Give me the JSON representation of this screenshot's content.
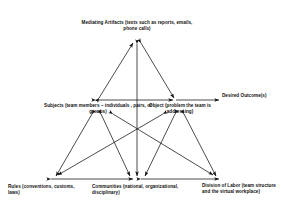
{
  "diagram": {
    "type": "activity-system-diagram",
    "stroke_color": "#111111",
    "background_color": "#ffffff",
    "nodes": [
      {
        "id": "mediating-artifacts",
        "label": "Mediating Artifacts (texts such as reports, emails, phone calls)",
        "x": 137,
        "y": 40
      },
      {
        "id": "subjects",
        "label": "Subjects (team members – individuals , pairs, or groups)",
        "x": 97,
        "y": 100
      },
      {
        "id": "object",
        "label": "Object (problem the team is addressing)",
        "x": 175,
        "y": 100
      },
      {
        "id": "desired-outcomes",
        "label": "Desired Outcome(s)",
        "x": 258,
        "y": 100
      },
      {
        "id": "rules",
        "label": "Rules (conventions, customs, laws)",
        "x": 53,
        "y": 178
      },
      {
        "id": "communities",
        "label": "Communities (national, organizational, disciplinary)",
        "x": 137,
        "y": 178
      },
      {
        "id": "division-of-labor",
        "label": "Division of Labor (team structure and the virtual workplace)",
        "x": 218,
        "y": 178
      }
    ],
    "edges": [
      {
        "from": "subjects",
        "to": "mediating-artifacts",
        "arrows": "both"
      },
      {
        "from": "mediating-artifacts",
        "to": "object",
        "arrows": "both"
      },
      {
        "from": "subjects",
        "to": "object",
        "arrows": "both"
      },
      {
        "from": "object",
        "to": "desired-outcomes",
        "arrows": "end"
      },
      {
        "from": "mediating-artifacts",
        "to": "communities",
        "arrows": "both"
      },
      {
        "from": "subjects",
        "to": "rules",
        "arrows": "both"
      },
      {
        "from": "subjects",
        "to": "communities",
        "arrows": "both"
      },
      {
        "from": "subjects",
        "to": "division-of-labor",
        "arrows": "both"
      },
      {
        "from": "object",
        "to": "rules",
        "arrows": "both"
      },
      {
        "from": "object",
        "to": "communities",
        "arrows": "both"
      },
      {
        "from": "object",
        "to": "division-of-labor",
        "arrows": "both"
      },
      {
        "from": "rules",
        "to": "communities",
        "arrows": "both"
      },
      {
        "from": "communities",
        "to": "division-of-labor",
        "arrows": "both"
      }
    ]
  }
}
